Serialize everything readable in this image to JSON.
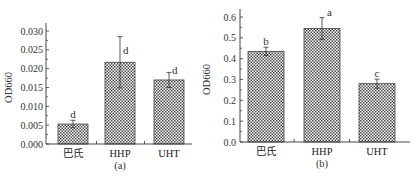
{
  "chart_data": [
    {
      "type": "bar",
      "panel_label": "(a)",
      "title": "",
      "xlabel": "",
      "ylabel": "OD660",
      "categories": [
        "巴氏",
        "HHP",
        "UHT"
      ],
      "values": [
        0.0053,
        0.0217,
        0.017
      ],
      "errors": [
        0.001,
        0.0068,
        0.002
      ],
      "significance": [
        "d",
        "d",
        "d"
      ],
      "ylim": [
        0.0,
        0.03
      ],
      "yticks": [
        "0.000",
        "0.005",
        "0.010",
        "0.015",
        "0.020",
        "0.025",
        "0.030"
      ],
      "grid": false,
      "legend": null,
      "bar_fill": "crosshatch"
    },
    {
      "type": "bar",
      "panel_label": "(b)",
      "title": "",
      "xlabel": "",
      "ylabel": "OD660",
      "categories": [
        "巴氏",
        "HHP",
        "UHT"
      ],
      "values": [
        0.435,
        0.545,
        0.28
      ],
      "errors": [
        0.02,
        0.052,
        0.022
      ],
      "significance": [
        "b",
        "a",
        "c"
      ],
      "ylim": [
        0.0,
        0.6
      ],
      "yticks": [
        "0.0",
        "0.1",
        "0.2",
        "0.3",
        "0.4",
        "0.5",
        "0.6"
      ],
      "grid": false,
      "legend": null,
      "bar_fill": "crosshatch"
    }
  ],
  "colors": {
    "axis": "#333333",
    "bar_dark": "#555555",
    "bar_light": "#ffffff"
  }
}
